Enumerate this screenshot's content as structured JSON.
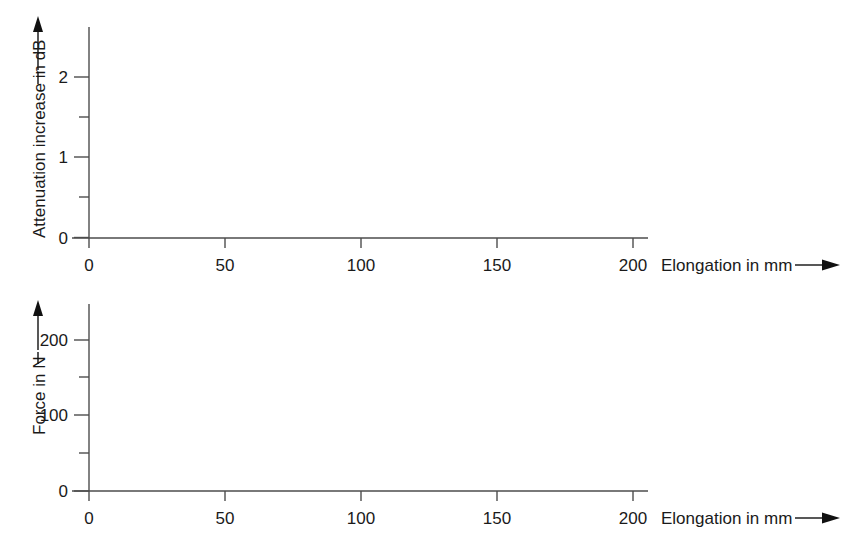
{
  "figure": {
    "background_color": "#ffffff",
    "curve_color": "#111111",
    "axis_color": "#4d4d4d",
    "text_color": "#1a1a1a"
  },
  "charts": {
    "top": {
      "ylabel": "Attenuation increase in dB",
      "ylabel_arrow": "up-arrow",
      "xlabel": "Elongation in mm",
      "xlabel_arrow": "right-arrow",
      "y_ticks": [
        "0",
        "1",
        "2"
      ],
      "y_minor_ticks": [
        "0.5",
        "1.5"
      ],
      "x_ticks": [
        "0",
        "50",
        "100",
        "150",
        "200"
      ]
    },
    "bottom": {
      "ylabel": "Force in N",
      "ylabel_arrow": "up-arrow",
      "xlabel": "Elongation in mm",
      "xlabel_arrow": "right-arrow",
      "y_ticks": [
        "0",
        "100",
        "200"
      ],
      "y_minor_ticks": [
        "50",
        "150"
      ],
      "x_ticks": [
        "0",
        "50",
        "100",
        "150",
        "200"
      ]
    }
  },
  "chart_data": [
    {
      "type": "line",
      "id": "attenuation-vs-elongation",
      "title": "",
      "xlabel": "Elongation in mm",
      "ylabel": "Attenuation increase in dB",
      "xlim": [
        0,
        208
      ],
      "ylim": [
        0,
        2.45
      ],
      "xticks": [
        0,
        50,
        100,
        150,
        200
      ],
      "yticks": [
        0,
        1,
        2
      ],
      "y_minor_ticks": [
        0.5,
        1.5
      ],
      "grid": false,
      "legend": "none",
      "series": [
        {
          "name": "Attenuation increase",
          "x": [
            0,
            5,
            10,
            15,
            20,
            25,
            30,
            35,
            40,
            45,
            50,
            55,
            60,
            65,
            70,
            75,
            80,
            85,
            90,
            95,
            100,
            105,
            110,
            115,
            120,
            125,
            130,
            135,
            140,
            145,
            150,
            155,
            160,
            165,
            170,
            175,
            180,
            185,
            187
          ],
          "y": [
            0.02,
            0.025,
            0.03,
            0.04,
            0.05,
            0.065,
            0.085,
            0.105,
            0.13,
            0.16,
            0.2,
            0.24,
            0.285,
            0.33,
            0.38,
            0.43,
            0.48,
            0.54,
            0.6,
            0.66,
            0.72,
            0.78,
            0.84,
            0.9,
            0.96,
            1.02,
            1.08,
            1.14,
            1.2,
            1.26,
            1.31,
            1.36,
            1.41,
            1.45,
            1.49,
            1.52,
            1.545,
            1.56,
            1.565
          ]
        }
      ]
    },
    {
      "type": "line",
      "id": "force-vs-elongation",
      "title": "",
      "xlabel": "Elongation in mm",
      "ylabel": "Force in N",
      "xlim": [
        0,
        208
      ],
      "ylim": [
        0,
        243
      ],
      "xticks": [
        0,
        50,
        100,
        150,
        200
      ],
      "yticks": [
        0,
        100,
        200
      ],
      "y_minor_ticks": [
        50,
        150
      ],
      "grid": false,
      "legend": "none",
      "series": [
        {
          "name": "Tensile force",
          "x": [
            0,
            1,
            2,
            3,
            4,
            6,
            8,
            10,
            13,
            16,
            20,
            24,
            28,
            32,
            36,
            40,
            45,
            50,
            55,
            60,
            64,
            68,
            72,
            76,
            82,
            88,
            95,
            102,
            110,
            118,
            126,
            134,
            142,
            150,
            158,
            165,
            172,
            178,
            183,
            186,
            188,
            189,
            190,
            191,
            192,
            193,
            194
          ],
          "y": [
            0,
            22,
            44,
            58,
            63,
            70,
            76,
            81,
            87,
            92,
            97,
            101,
            104,
            105,
            106,
            106,
            105.5,
            105,
            104,
            103,
            102.5,
            103,
            105,
            108,
            112,
            116,
            119,
            121,
            124,
            127,
            130,
            133,
            137,
            141,
            147,
            153,
            160,
            167,
            171,
            173,
            173,
            172,
            168,
            150,
            110,
            55,
            0
          ]
        }
      ]
    }
  ]
}
